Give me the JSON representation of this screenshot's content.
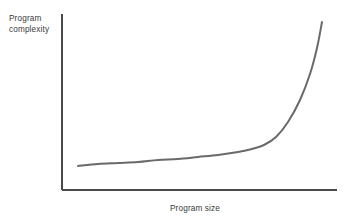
{
  "figure": {
    "background_color": "#ffffff",
    "width": 349,
    "height": 218
  },
  "axes": {
    "line_color": "#4a4a4a",
    "y_axis": {
      "x": 62,
      "y_top": 14,
      "y_bottom": 190
    },
    "x_axis": {
      "y": 190,
      "x_left": 62,
      "x_right": 337
    }
  },
  "labels": {
    "ylabel": "Program\ncomplexity",
    "xlabel": "Program size",
    "text_color": "#3a3a3a"
  },
  "chart_data": {
    "type": "line",
    "title": "",
    "xlabel": "Program size",
    "ylabel": "Program complexity",
    "grid": false,
    "legend": null,
    "axis_ticks": {
      "x": [],
      "y": []
    },
    "xlim": [
      0,
      1
    ],
    "ylim": [
      0,
      1
    ],
    "series": [
      {
        "name": "complexity-growth",
        "color": "#6a6a6a",
        "line_width": 2,
        "description": "Exponential growth: complexity rises slowly at small program sizes, then sharply at large sizes",
        "x": [
          0.0,
          0.1,
          0.2,
          0.3,
          0.4,
          0.5,
          0.6,
          0.68,
          0.74,
          0.8,
          0.85,
          0.89,
          0.93,
          0.96,
          1.0
        ],
        "y": [
          0.0,
          0.03,
          0.06,
          0.09,
          0.12,
          0.16,
          0.2,
          0.25,
          0.31,
          0.41,
          0.53,
          0.65,
          0.78,
          0.88,
          1.0
        ],
        "pixel_points": [
          [
            78,
            166
          ],
          [
            98,
            164
          ],
          [
            118,
            163
          ],
          [
            138,
            162
          ],
          [
            158,
            160
          ],
          [
            178,
            159
          ],
          [
            198,
            157
          ],
          [
            218,
            155
          ],
          [
            238,
            152
          ],
          [
            252,
            149
          ],
          [
            264,
            145
          ],
          [
            276,
            137
          ],
          [
            288,
            122
          ],
          [
            300,
            100
          ],
          [
            310,
            74
          ],
          [
            317,
            48
          ],
          [
            322,
            22
          ]
        ]
      }
    ]
  }
}
